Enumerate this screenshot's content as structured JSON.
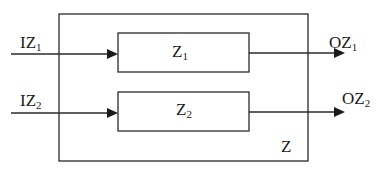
{
  "diagram": {
    "type": "block-diagram",
    "outer_block": {
      "label": "Z"
    },
    "blocks": [
      {
        "id": "z1",
        "label": "Z",
        "subscript": "1"
      },
      {
        "id": "z2",
        "label": "Z",
        "subscript": "2"
      }
    ],
    "inputs": [
      {
        "id": "iz1",
        "label": "IZ",
        "subscript": "1",
        "to": "z1"
      },
      {
        "id": "iz2",
        "label": "IZ",
        "subscript": "2",
        "to": "z2"
      }
    ],
    "outputs": [
      {
        "id": "oz1",
        "label": "OZ",
        "subscript": "1",
        "from": "z1"
      },
      {
        "id": "oz2",
        "label": "OZ",
        "subscript": "2",
        "from": "z2"
      }
    ],
    "colors": {
      "stroke": "#2a2a2a",
      "text": "#1a1a1a",
      "background": "#ffffff"
    }
  }
}
